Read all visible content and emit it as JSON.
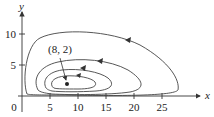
{
  "figure": {
    "type": "phase-portrait",
    "x_axis_label": "x",
    "y_axis_label": "y",
    "x_ticks": [
      "5",
      "10",
      "15",
      "20",
      "25"
    ],
    "y_ticks": [
      "5",
      "10"
    ],
    "origin_label": "0",
    "equilibrium_label": "(8, 2)",
    "equilibrium_point": {
      "x": 8,
      "y": 2
    },
    "curve_count": 4,
    "orientation": "counterclockwise",
    "colors": {
      "curve": "#444444",
      "axis": "#333333",
      "background": "#ffffff"
    }
  }
}
